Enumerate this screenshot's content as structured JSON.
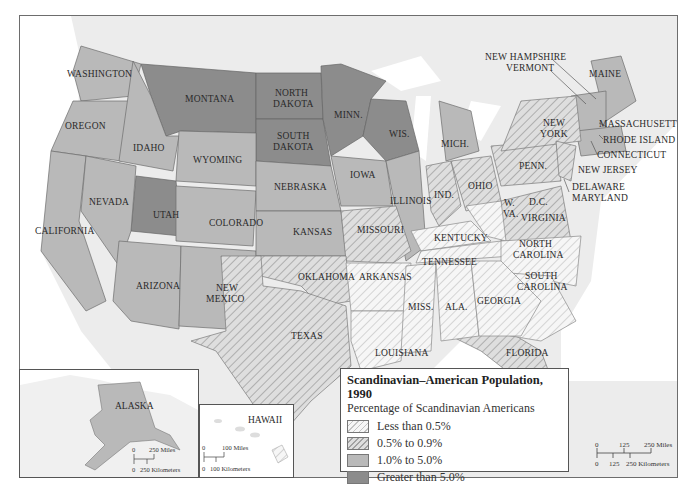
{
  "legend": {
    "title": "Scandinavian–American Population, 1990",
    "subtitle": "Percentage of Scandinavian Americans",
    "items": [
      {
        "label": "Less than 0.5%",
        "pattern": "light-hatch",
        "color": "#f4f4f4"
      },
      {
        "label": "0.5% to 0.9%",
        "pattern": "dark-hatch",
        "color": "#d4d4d4"
      },
      {
        "label": "1.0% to 5.0%",
        "pattern": "solid",
        "color": "#b9b9b9"
      },
      {
        "label": "Greater than 5.0%",
        "pattern": "solid",
        "color": "#8c8c8c"
      }
    ]
  },
  "states": {
    "greater_than_5": [
      "MONTANA",
      "NORTH DAKOTA",
      "SOUTH DAKOTA",
      "MINN.",
      "WIS.",
      "UTAH"
    ],
    "between_1_and_5": [
      "WASHINGTON",
      "OREGON",
      "IDAHO",
      "WYOMING",
      "CALIFORNIA",
      "NEVADA",
      "COLORADO",
      "ARIZONA",
      "NEW MEXICO",
      "NEBRASKA",
      "KANSAS",
      "IOWA",
      "ILLINOIS",
      "MICH.",
      "MAINE",
      "NEW HAMPSHIRE",
      "VERMONT",
      "MASSACHUSETTS",
      "RHODE ISLAND",
      "CONNECTICUT",
      "ALASKA"
    ],
    "between_0_5_and_0_9": [
      "MISSOURI",
      "OKLAHOMA",
      "TEXAS",
      "IND.",
      "OHIO",
      "PENN.",
      "NEW YORK",
      "NEW JERSEY",
      "DELAWARE",
      "MARYLAND",
      "D.C.",
      "VIRGINIA",
      "FLORIDA"
    ],
    "less_than_0_5": [
      "ARKANSAS",
      "LOUISIANA",
      "KENTUCKY",
      "TENNESSEE",
      "W. VA.",
      "NORTH CAROLINA",
      "SOUTH CAROLINA",
      "MISS.",
      "ALA.",
      "GEORGIA",
      "HAWAII"
    ]
  },
  "labels": {
    "washington": "WASHINGTON",
    "oregon": "OREGON",
    "idaho": "IDAHO",
    "montana": "MONTANA",
    "wyoming": "WYOMING",
    "nd1": "NORTH",
    "nd2": "DAKOTA",
    "sd1": "SOUTH",
    "sd2": "DAKOTA",
    "minn": "MINN.",
    "wis": "WIS.",
    "mich": "MICH.",
    "california": "CALIFORNIA",
    "nevada": "NEVADA",
    "utah": "UTAH",
    "colorado": "COLORADO",
    "nebraska": "NEBRASKA",
    "iowa": "IOWA",
    "illinois": "ILLINOIS",
    "kansas": "KANSAS",
    "missouri": "MISSOURI",
    "arizona": "ARIZONA",
    "nm1": "NEW",
    "nm2": "MEXICO",
    "oklahoma": "OKLAHOMA",
    "texas": "TEXAS",
    "arkansas": "ARKANSAS",
    "louisiana": "LOUISIANA",
    "miss": "MISS.",
    "ala": "ALA.",
    "georgia": "GEORGIA",
    "florida": "FLORIDA",
    "tennessee": "TENNESSEE",
    "kentucky": "KENTUCKY",
    "ind": "IND.",
    "ohio": "OHIO",
    "wva1": "W.",
    "wva2": "VA.",
    "virginia": "VIRGINIA",
    "dc": "D.C.",
    "nc1": "NORTH",
    "nc2": "CAROLINA",
    "sc1": "SOUTH",
    "sc2": "CAROLINA",
    "penn": "PENN.",
    "ny1": "NEW",
    "ny2": "YORK",
    "nh": "NEW HAMPSHIRE",
    "vermont": "VERMONT",
    "maine": "MAINE",
    "massachusetts": "MASSACHUSETTS",
    "rhode_island": "RHODE ISLAND",
    "connecticut": "CONNECTICUT",
    "new_jersey": "NEW JERSEY",
    "delaware": "DELAWARE",
    "maryland": "MARYLAND"
  },
  "insets": {
    "alaska": {
      "label": "ALASKA",
      "scale_miles": "250 Miles",
      "scale_km": "250 Kilometers",
      "zero": "0"
    },
    "hawaii": {
      "label": "HAWAII",
      "scale_miles": "100 Miles",
      "scale_km": "100 Kilometers",
      "zero": "0"
    }
  },
  "main_scale": {
    "miles_mid": "125",
    "miles_end": "250 Miles",
    "km_mid": "125",
    "km_end": "250 Kilometers",
    "zero": "0"
  }
}
